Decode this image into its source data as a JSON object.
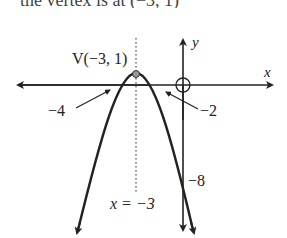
{
  "caption": {
    "text": "the vertex is at (−3, 1)"
  },
  "diagram": {
    "type": "parabola-graph",
    "colors": {
      "ink": "#222222",
      "vertex_fill": "#999999"
    },
    "axes": {
      "x_label": "x",
      "y_label": "y"
    },
    "vertex": {
      "label": "V(−3, 1)",
      "x": -3,
      "y": 1
    },
    "axis_of_symmetry": {
      "label": "x = −3"
    },
    "x_intercepts": [
      {
        "label": "−4",
        "value": -4
      },
      {
        "label": "−2",
        "value": -2
      }
    ],
    "y_intercept": {
      "label": "−8",
      "value": -8
    },
    "origin_marker": "circle-icon"
  }
}
